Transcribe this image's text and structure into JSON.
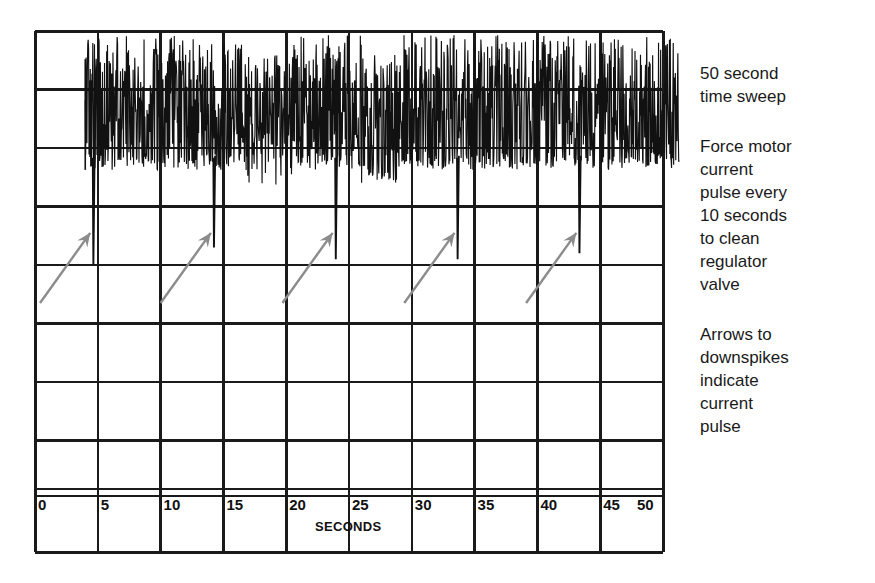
{
  "figure": {
    "background": "#ffffff",
    "grid_color": "#1a1a1a",
    "trace_color": "#111111",
    "arrow_color": "#8c8c8c"
  },
  "axis": {
    "label": "SECONDS",
    "ticks": [
      "0",
      "5",
      "10",
      "15",
      "20",
      "25",
      "30",
      "35",
      "40",
      "45",
      "50"
    ]
  },
  "annotations": [
    {
      "id": "sweep-note",
      "text": "50 second\ntime sweep"
    },
    {
      "id": "pulse-note",
      "text": "Force motor\ncurrent\npulse every\n10 seconds\nto clean\nregulator\nvalve"
    },
    {
      "id": "arrow-note",
      "text": "Arrows to\ndownspikes\nindicate\ncurrent\npulse"
    }
  ],
  "chart_data": {
    "type": "line",
    "title": "",
    "xlabel": "SECONDS",
    "ylabel": "",
    "xlim": [
      0,
      50
    ],
    "ylim": [
      0,
      9
    ],
    "grid": true,
    "legend": false,
    "x_ticks": [
      0,
      5,
      10,
      15,
      20,
      25,
      30,
      35,
      40,
      45,
      50
    ],
    "grid_rows": 9,
    "grid_cols": 10,
    "signal": {
      "name": "force motor current",
      "noise_start_seconds": 4.0,
      "noise_end_seconds": 51.3,
      "baseline_level": 7.6,
      "noise_band_top": 8.45,
      "noise_band_bottom": 6.9
    },
    "downspikes": {
      "description": "Force motor current pulse every 10 seconds",
      "period_seconds": 10,
      "count": 5,
      "seconds": [
        4.6,
        14.2,
        23.9,
        33.6,
        43.3
      ],
      "depth_level": [
        5.0,
        5.3,
        5.1,
        5.1,
        5.2
      ]
    },
    "arrows": {
      "color": "#8c8c8c",
      "count": 5,
      "description": "Arrows to downspikes indicate current pulse",
      "tip_seconds": [
        4.4,
        14.0,
        23.7,
        33.4,
        43.1
      ],
      "tip_level": [
        5.55,
        5.55,
        5.55,
        5.55,
        5.55
      ],
      "tail_seconds": [
        0.4,
        10.0,
        19.7,
        29.4,
        39.1
      ],
      "tail_level": [
        4.35,
        4.35,
        4.35,
        4.35,
        4.35
      ]
    }
  }
}
